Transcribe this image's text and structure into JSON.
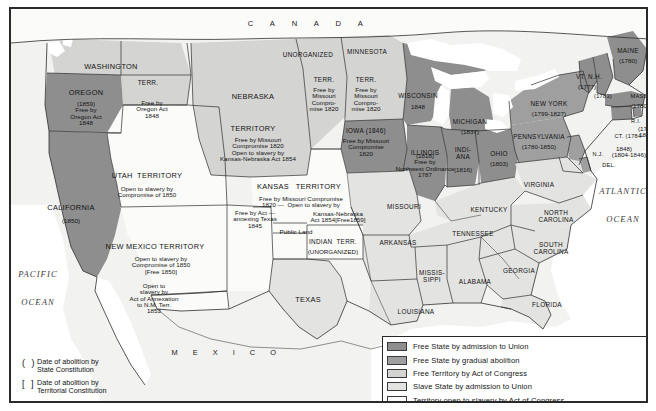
{
  "map": {
    "title": "Slavery and Abolition in the United States, c. 1854",
    "countries": [
      {
        "name": "canada",
        "label": "C A N A D A",
        "x": 298,
        "y": 15
      },
      {
        "name": "mexico",
        "label": "M E X I C O",
        "x": 216,
        "y": 344
      }
    ],
    "oceans": [
      {
        "name": "pacific-ocean",
        "lines": [
          "PACIFIC",
          "OCEAN"
        ],
        "x": 27,
        "y": 265
      },
      {
        "name": "atlantic-ocean",
        "lines": [
          "ATLANTIC",
          "OCEAN"
        ],
        "x": 612,
        "y": 182
      }
    ],
    "regions": [
      {
        "name": "washington-territory",
        "label": "WASHINGTON",
        "x": 100,
        "y": 58,
        "size": "state-name",
        "note": ""
      },
      {
        "name": "washington-terr-abbrev",
        "label": "TERR.",
        "x": 137,
        "y": 74,
        "size": "state-name sm",
        "note": "Free by\nOregon Act\n1848",
        "note_x": 141,
        "note_y": 100
      },
      {
        "name": "oregon",
        "label": "OREGON",
        "x": 75,
        "y": 84,
        "size": "state-name",
        "note": "(1859)\nFree by\nOregon Act\n1848",
        "note_x": 75,
        "note_y": 105
      },
      {
        "name": "california",
        "label": "CALIFORNIA",
        "x": 60,
        "y": 199,
        "size": "state-name",
        "note": "(1850)",
        "note_x": 60,
        "note_y": 212
      },
      {
        "name": "utah-territory",
        "label": "UTAH  TERRITORY",
        "x": 136,
        "y": 167,
        "size": "state-name",
        "note": "Open to slavery by\nCompromise of 1850",
        "note_x": 136,
        "note_y": 183
      },
      {
        "name": "new-mexico-territory",
        "label": "NEW MEXICO TERRITORY",
        "x": 144,
        "y": 238,
        "size": "state-name",
        "note": "Open to slavery by\nCompromise of 1850\n[Free 1850]",
        "note_x": 150,
        "note_y": 256
      },
      {
        "name": "gadsden-strip",
        "label": "",
        "x": 0,
        "y": 0,
        "size": "",
        "note": "Open to\nslavery by\nAct of Annexation\nto N.M. Terr.\n1853",
        "note_x": 143,
        "note_y": 290
      },
      {
        "name": "nebraska-territory",
        "label": "NEBRASKA",
        "x": 242,
        "y": 88,
        "size": "state-name",
        "note": "",
        "note_x": 0,
        "note_y": 0
      },
      {
        "name": "nebraska-territory-2",
        "label": "TERRITORY",
        "x": 242,
        "y": 120,
        "size": "state-name",
        "note": "Free by Missouri\nCompromise 1820\nOpen to slavery by\nKansas-Nebraska Act 1854",
        "note_x": 247,
        "note_y": 141
      },
      {
        "name": "unorganized-territory",
        "label": "UNORGANIZED",
        "x": 297,
        "y": 46,
        "size": "state-name sm",
        "note": "",
        "note_x": 0,
        "note_y": 0
      },
      {
        "name": "unorganized-terr-abbrev",
        "label": "TERR.",
        "x": 313,
        "y": 71,
        "size": "state-name sm",
        "note": "Free by\nMissouri\nCompro-\nmise 1820",
        "note_x": 313,
        "note_y": 91
      },
      {
        "name": "minnesota-territory",
        "label": "MINNESOTA",
        "x": 356,
        "y": 43,
        "size": "state-name sm",
        "note": "",
        "note_x": 0,
        "note_y": 0
      },
      {
        "name": "minnesota-terr-abbrev",
        "label": "TERR.",
        "x": 355,
        "y": 71,
        "size": "state-name sm",
        "note": "Free by\nMissouri\nCompro-\nmise 1820",
        "note_x": 355,
        "note_y": 91
      },
      {
        "name": "wisconsin",
        "label": "WISCONSIN",
        "x": 407,
        "y": 87,
        "size": "state-name sm",
        "note": "1848",
        "note_x": 407,
        "note_y": 98
      },
      {
        "name": "iowa",
        "label": "IOWA (1846)",
        "x": 355,
        "y": 122,
        "size": "state-name sm",
        "note": "Free by Missouri\nCompromise\n1820",
        "note_x": 355,
        "note_y": 138
      },
      {
        "name": "michigan",
        "label": "MICHIGAN",
        "x": 459,
        "y": 113,
        "size": "state-name sm",
        "note": "(1837)",
        "note_x": 459,
        "note_y": 123
      },
      {
        "name": "illinois",
        "label": "ILLINOIS",
        "x": 414,
        "y": 144,
        "size": "state-name sm",
        "note": "(1818)\nFree by\nNorthwest Ordinance\n1787",
        "note_x": 414,
        "note_y": 157
      },
      {
        "name": "indiana",
        "label": "INDI-\nANA",
        "x": 452,
        "y": 145,
        "size": "state-name sm",
        "note": "(1816)",
        "note_x": 452,
        "note_y": 161
      },
      {
        "name": "ohio",
        "label": "OHIO",
        "x": 488,
        "y": 145,
        "size": "state-name sm",
        "note": "(1803)",
        "note_x": 488,
        "note_y": 155
      },
      {
        "name": "pennsylvania",
        "label": "PENNSYLVANIA",
        "x": 528,
        "y": 128,
        "size": "state-name sm",
        "note": "(1780-1850)",
        "note_x": 528,
        "note_y": 138
      },
      {
        "name": "new-york",
        "label": "NEW YORK",
        "x": 538,
        "y": 95,
        "size": "state-name sm",
        "note": "(1799-1827)",
        "note_x": 538,
        "note_y": 105
      },
      {
        "name": "vermont-new-hampshire",
        "label": "VT. N.H.",
        "x": 578,
        "y": 68,
        "size": "state-name sm",
        "note": "(1777)",
        "note_x": 576,
        "note_y": 78
      },
      {
        "name": "new-hampshire-date",
        "label": "(1783)",
        "x": 592,
        "y": 88,
        "size": "state-name xs",
        "note": "",
        "note_x": 0,
        "note_y": 0
      },
      {
        "name": "maine",
        "label": "MAINE",
        "x": 617,
        "y": 42,
        "size": "state-name sm",
        "note": "(1780)",
        "note_x": 617,
        "note_y": 52
      },
      {
        "name": "massachusetts",
        "label": "MASS.",
        "x": 629,
        "y": 88,
        "size": "state-name xs",
        "note": "(1780)",
        "note_x": 629,
        "note_y": 97
      },
      {
        "name": "rhode-island",
        "label": "R.I.",
        "x": 625,
        "y": 113,
        "size": "state-name xs",
        "note": "(1784-\n1842)",
        "note_x": 636,
        "note_y": 123
      },
      {
        "name": "connecticut",
        "label": "CT. (1784-",
        "x": 618,
        "y": 128,
        "size": "state-name xs",
        "note": "1848)",
        "note_x": 613,
        "note_y": 140
      },
      {
        "name": "new-jersey",
        "label": "N.J.",
        "x": 587,
        "y": 146,
        "size": "state-name xs",
        "note": "(1804-1846)",
        "note_x": 618,
        "note_y": 146
      },
      {
        "name": "delaware",
        "label": "DEL.",
        "x": 598,
        "y": 157,
        "size": "state-name xs",
        "note": "",
        "note_x": 0,
        "note_y": 0
      },
      {
        "name": "virginia",
        "label": "VIRGINIA",
        "x": 528,
        "y": 176,
        "size": "state-name sm",
        "note": "",
        "note_x": 0,
        "note_y": 0
      },
      {
        "name": "kentucky",
        "label": "KENTUCKY",
        "x": 478,
        "y": 201,
        "size": "state-name sm",
        "note": "",
        "note_x": 0,
        "note_y": 0
      },
      {
        "name": "north-carolina",
        "label": "NORTH\nCAROLINA",
        "x": 545,
        "y": 208,
        "size": "state-name sm",
        "note": "",
        "note_x": 0,
        "note_y": 0
      },
      {
        "name": "tennessee",
        "label": "TENNESSEE",
        "x": 462,
        "y": 225,
        "size": "state-name sm",
        "note": "",
        "note_x": 0,
        "note_y": 0
      },
      {
        "name": "south-carolina",
        "label": "SOUTH\nCAROLINA",
        "x": 540,
        "y": 240,
        "size": "state-name sm",
        "note": "",
        "note_x": 0,
        "note_y": 0
      },
      {
        "name": "georgia",
        "label": "GEORGIA",
        "x": 508,
        "y": 262,
        "size": "state-name sm",
        "note": "",
        "note_x": 0,
        "note_y": 0
      },
      {
        "name": "alabama",
        "label": "ALABAMA",
        "x": 464,
        "y": 273,
        "size": "state-name sm",
        "note": "",
        "note_x": 0,
        "note_y": 0
      },
      {
        "name": "mississippi",
        "label": "MISSIS-\nSIPPI",
        "x": 421,
        "y": 268,
        "size": "state-name sm",
        "note": "",
        "note_x": 0,
        "note_y": 0
      },
      {
        "name": "florida",
        "label": "FLORIDA",
        "x": 536,
        "y": 296,
        "size": "state-name sm",
        "note": "",
        "note_x": 0,
        "note_y": 0
      },
      {
        "name": "louisiana",
        "label": "LOUISIANA",
        "x": 405,
        "y": 303,
        "size": "state-name sm",
        "note": "",
        "note_x": 0,
        "note_y": 0
      },
      {
        "name": "arkansas",
        "label": "ARKANSAS",
        "x": 387,
        "y": 234,
        "size": "state-name sm",
        "note": "",
        "note_x": 0,
        "note_y": 0
      },
      {
        "name": "missouri",
        "label": "MISSOURI",
        "x": 393,
        "y": 198,
        "size": "state-name sm",
        "note": "",
        "note_x": 0,
        "note_y": 0
      },
      {
        "name": "texas",
        "label": "TEXAS",
        "x": 297,
        "y": 291,
        "size": "state-name",
        "note": "",
        "note_x": 0,
        "note_y": 0
      },
      {
        "name": "kansas-territory",
        "label": "KANSAS   TERRITORY",
        "x": 288,
        "y": 178,
        "size": "state-name",
        "note": "Free by Missouri Compromise\n1820 —  Open to slavery by",
        "note_x": 290,
        "note_y": 193
      },
      {
        "name": "kansas-nebraska-act-note",
        "label": "",
        "x": 0,
        "y": 0,
        "size": "",
        "note": "Kansas-Nebraska\nAct 1854[Free1859]",
        "note_x": 327,
        "note_y": 208
      },
      {
        "name": "texas-annexation-note",
        "label": "",
        "x": 0,
        "y": 0,
        "size": "",
        "note": "Free by Act —\nannexing Texas\n1845",
        "note_x": 244,
        "note_y": 210
      },
      {
        "name": "public-land-strip",
        "label": "Public Land",
        "x": 285,
        "y": 223,
        "size": "note",
        "note": "",
        "note_x": 0,
        "note_y": 0
      },
      {
        "name": "indian-territory",
        "label": "INDIAN  TERR.",
        "x": 322,
        "y": 233,
        "size": "state-name sm",
        "note": "(UNORGANIZED)",
        "note_x": 322,
        "note_y": 243
      }
    ],
    "legend": {
      "categories": [
        {
          "name": "free-state-admission",
          "color": "#8e8e8e",
          "label": "Free State by admission to Union"
        },
        {
          "name": "free-state-gradual-abolition",
          "color": "#9f9f9f",
          "label": "Free State by gradual abolition"
        },
        {
          "name": "free-territory-congress",
          "color": "#d4d4d2",
          "label": "Free Territory by Act of Congress"
        },
        {
          "name": "slave-state-admission",
          "color": "#e3e3e1",
          "label": "Slave State by admission to Union"
        },
        {
          "name": "territory-open-slavery",
          "color": "#fbfbfa",
          "label": "Territory open to slavery by Act of Congress"
        }
      ],
      "date_notation": [
        {
          "name": "state-constitution-date",
          "mark": "(  )",
          "text": "Date of abolition by\nState Constitution"
        },
        {
          "name": "territorial-constitution-date",
          "mark": "[  ]",
          "text": "Date of abolition by\nTerritorial Constitution"
        }
      ]
    }
  }
}
